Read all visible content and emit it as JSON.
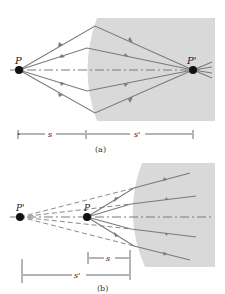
{
  "figure_a": {
    "caption": "(a)",
    "object_label": "P",
    "image_label": "P'",
    "dim_s_label": "s",
    "dim_sprime_label": "s'"
  },
  "figure_b": {
    "caption": "(b)",
    "object_label": "P",
    "image_label": "P'",
    "dim_s_label": "s",
    "dim_sprime_label": "s'"
  },
  "colors": {
    "medium": "#d9d9d9",
    "ray": "#7a7a7a",
    "point": "#111111"
  }
}
